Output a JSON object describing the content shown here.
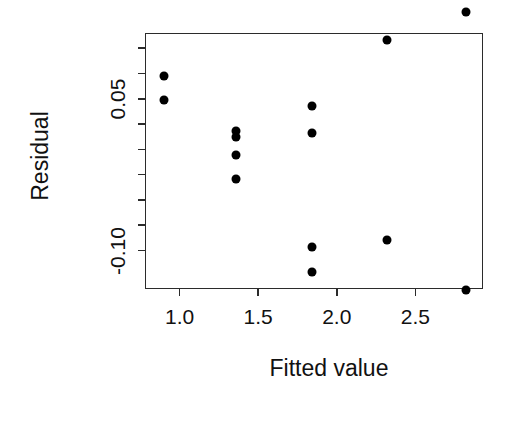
{
  "chart_data": {
    "type": "scatter",
    "title": "",
    "xlabel": "Fitted value",
    "ylabel": "Residual",
    "xlim": [
      0.78,
      2.93
    ],
    "ylim": [
      -0.138,
      0.115
    ],
    "grid": false,
    "legend": null,
    "xticks": [
      {
        "value": 1.0,
        "label": "1.0"
      },
      {
        "value": 1.5,
        "label": "1.5"
      },
      {
        "value": 2.0,
        "label": "2.0"
      },
      {
        "value": 2.5,
        "label": "2.5"
      }
    ],
    "yticks": [
      {
        "value": 0.1,
        "label": ""
      },
      {
        "value": 0.075,
        "label": ""
      },
      {
        "value": 0.05,
        "label": "0.05"
      },
      {
        "value": 0.025,
        "label": ""
      },
      {
        "value": 0.0,
        "label": ""
      },
      {
        "value": -0.025,
        "label": ""
      },
      {
        "value": -0.05,
        "label": ""
      },
      {
        "value": -0.075,
        "label": ""
      },
      {
        "value": -0.1,
        "label": "-0.10"
      }
    ],
    "points": [
      {
        "x": 0.9,
        "y": 0.0725
      },
      {
        "x": 0.9,
        "y": 0.0485
      },
      {
        "x": 1.36,
        "y": 0.0185
      },
      {
        "x": 1.36,
        "y": 0.0125
      },
      {
        "x": 1.36,
        "y": -0.0055
      },
      {
        "x": 1.36,
        "y": -0.0295
      },
      {
        "x": 1.84,
        "y": 0.0425
      },
      {
        "x": 1.84,
        "y": 0.0165
      },
      {
        "x": 1.84,
        "y": -0.0965
      },
      {
        "x": 1.84,
        "y": -0.1215
      },
      {
        "x": 2.32,
        "y": 0.1085
      },
      {
        "x": 2.32,
        "y": -0.0895
      },
      {
        "x": 2.82,
        "y": 0.1355
      },
      {
        "x": 2.82,
        "y": -0.1385
      }
    ],
    "marker": {
      "shape": "circle",
      "color": "#000000",
      "size": 9
    }
  },
  "axes": {
    "x_title": "Fitted value",
    "y_title": "Residual"
  }
}
